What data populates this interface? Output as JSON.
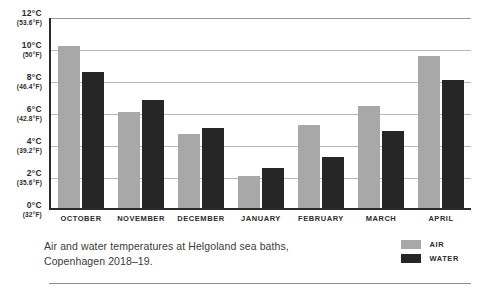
{
  "chart_data": {
    "type": "bar",
    "title": "",
    "xlabel": "",
    "ylabel": "",
    "ylim": [
      0,
      12
    ],
    "grid": true,
    "legend_position": "bottom-right",
    "categories": [
      "OCTOBER",
      "NOVEMBER",
      "DECEMBER",
      "JANUARY",
      "FEBRUARY",
      "MARCH",
      "APRIL"
    ],
    "series": [
      {
        "name": "AIR",
        "color": "#a8a8a8",
        "values": [
          10.1,
          6.0,
          4.6,
          2.0,
          5.2,
          6.4,
          9.5
        ]
      },
      {
        "name": "WATER",
        "color": "#262626",
        "values": [
          8.5,
          6.75,
          5.0,
          2.5,
          3.2,
          4.8,
          8.0
        ]
      }
    ],
    "yticks": [
      {
        "value": 12,
        "celsius": "12°C",
        "fahrenheit": "(53.6°F)"
      },
      {
        "value": 10,
        "celsius": "10°C",
        "fahrenheit": "(50°F)"
      },
      {
        "value": 8,
        "celsius": "8°C",
        "fahrenheit": "(46.4°F)"
      },
      {
        "value": 6,
        "celsius": "6°C",
        "fahrenheit": "(42.8°F)"
      },
      {
        "value": 4,
        "celsius": "4°C",
        "fahrenheit": "(39.2°F)"
      },
      {
        "value": 2,
        "celsius": "2°C",
        "fahrenheit": "(35.6°F)"
      },
      {
        "value": 0,
        "celsius": "0°C",
        "fahrenheit": "(32°F)"
      }
    ],
    "caption_line1": "Air and water temperatures at Helgoland sea baths,",
    "caption_line2": "Copenhagen 2018–19."
  },
  "colors": {
    "air": "#a8a8a8",
    "water": "#262626",
    "axis": "#2b2b2b",
    "grid": "#b9b9b9",
    "background": "#ffffff"
  }
}
